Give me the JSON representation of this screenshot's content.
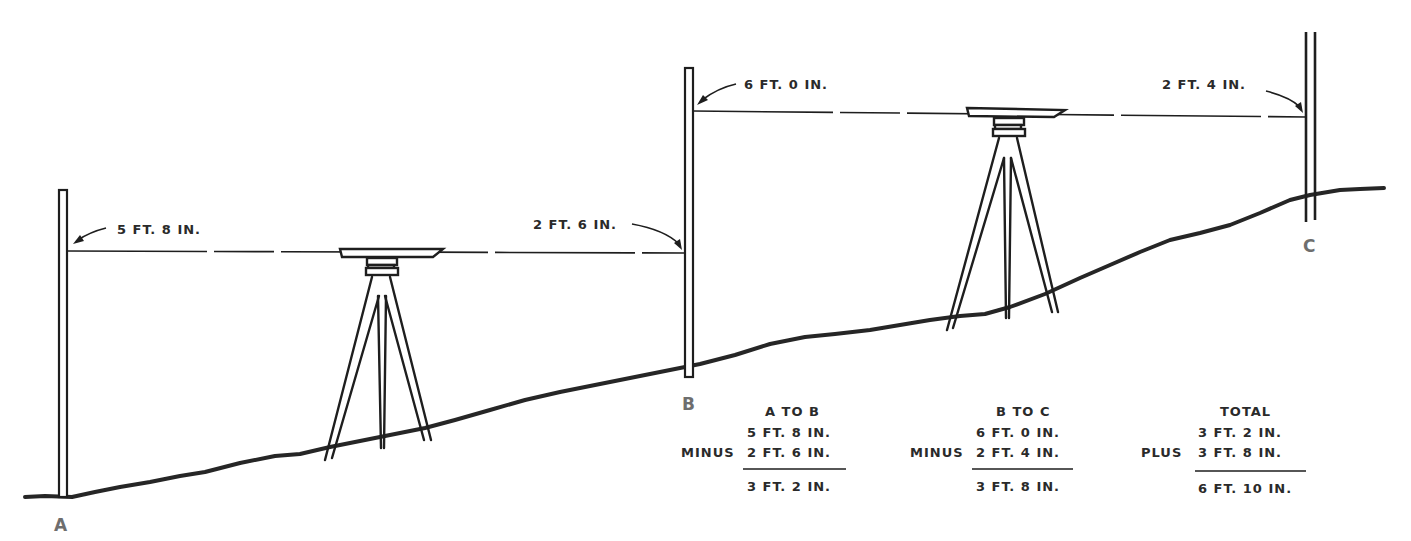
{
  "diagram": {
    "points": {
      "a": {
        "label": "A"
      },
      "b": {
        "label": "B"
      },
      "c": {
        "label": "C"
      }
    },
    "rod_readings": {
      "a_backsight": "5 FT. 8 IN.",
      "b_foresight": "2 FT. 6 IN.",
      "b_backsight": "6 FT. 0 IN.",
      "c_foresight": "2 FT. 4 IN."
    },
    "calculations": [
      {
        "heading": "A TO B",
        "line1": "5 FT. 8 IN.",
        "operator": "MINUS",
        "line2": "2 FT. 6 IN.",
        "result": "3 FT. 2 IN."
      },
      {
        "heading": "B TO C",
        "line1": "6 FT. 0 IN.",
        "operator": "MINUS",
        "line2": "2 FT. 4 IN.",
        "result": "3 FT. 8 IN."
      },
      {
        "heading": "TOTAL",
        "line1": "3 FT. 2 IN.",
        "operator": "PLUS",
        "line2": "3 FT. 8 IN.",
        "result": "6 FT. 10 IN."
      }
    ],
    "colors": {
      "ink": "#1e1e1e",
      "point_label": "#6e6e6e",
      "background": "#ffffff"
    }
  }
}
